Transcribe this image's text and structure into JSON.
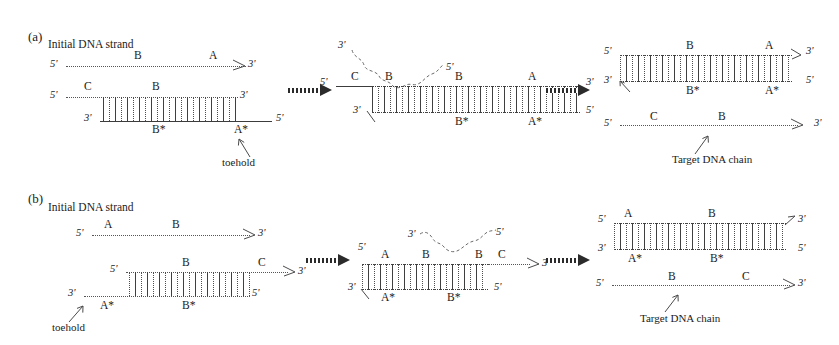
{
  "figure": {
    "background_color": "#ffffff",
    "ink_color": "#1b1b1b",
    "panels": [
      {
        "tag": "(a)",
        "caption": "Initial DNA strand",
        "stages": [
          {
            "name": "reactants",
            "strands": [
              {
                "name": "invader-strand",
                "left_end": "5'",
                "right_end": "3'",
                "domains": [
                  "B",
                  "A"
                ]
              },
              {
                "name": "substrate-top-strand",
                "left_end": "5'",
                "right_end": "3'",
                "domains": [
                  "C",
                  "B"
                ]
              },
              {
                "name": "substrate-bottom-strand",
                "left_end": "3'",
                "right_end": "5'",
                "domains": [
                  "B*",
                  "A*"
                ]
              }
            ],
            "annotation": "toehold"
          },
          {
            "name": "branch-migration-intermediate",
            "top_labels": [
              "3'",
              "5'"
            ],
            "left_end": "5'",
            "right_end": "3'",
            "bottom_left_end": "3'",
            "bottom_right_end": "5'",
            "top_domains": [
              "C",
              "B",
              "B",
              "A"
            ],
            "bottom_domains": [
              "B*",
              "A*"
            ]
          },
          {
            "name": "products",
            "duplex": {
              "left_top_end": "5'",
              "right_top_end": "3'",
              "left_bottom_end": "3'",
              "right_bottom_end": "5'",
              "top_domains": [
                "B",
                "A"
              ],
              "bottom_domains": [
                "B*",
                "A*"
              ]
            },
            "released_strand": {
              "left_end": "5'",
              "right_end": "3'",
              "domains": [
                "C",
                "B"
              ],
              "annotation": "Target DNA chain"
            }
          }
        ]
      },
      {
        "tag": "(b)",
        "caption": "Initial DNA strand",
        "stages": [
          {
            "name": "reactants",
            "strands": [
              {
                "name": "invader-strand",
                "left_end": "5'",
                "right_end": "3'",
                "domains": [
                  "A",
                  "B"
                ]
              },
              {
                "name": "substrate-top-strand",
                "left_end": "5'",
                "right_end": "3'",
                "domains": [
                  "B",
                  "C"
                ]
              },
              {
                "name": "substrate-bottom-strand",
                "left_end": "3'",
                "right_end": "5'",
                "domains": [
                  "A*",
                  "B*"
                ]
              }
            ],
            "annotation": "toehold"
          },
          {
            "name": "branch-migration-intermediate",
            "top_labels": [
              "3'",
              "5'"
            ],
            "left_end": "5'",
            "right_end": "3'",
            "bottom_left_end": "3'",
            "bottom_right_end": "5'",
            "top_domains": [
              "A",
              "B",
              "B",
              "C"
            ],
            "bottom_domains": [
              "A*",
              "B*"
            ]
          },
          {
            "name": "products",
            "duplex": {
              "left_top_end": "5'",
              "right_top_end": "3'",
              "left_bottom_end": "3'",
              "right_bottom_end": "5'",
              "top_domains": [
                "A",
                "B"
              ],
              "bottom_domains": [
                "A*",
                "B*"
              ]
            },
            "released_strand": {
              "left_end": "5'",
              "right_end": "3'",
              "domains": [
                "B",
                "C"
              ],
              "annotation": "Target DNA chain"
            }
          }
        ]
      }
    ]
  },
  "a": {
    "tag": "(a)",
    "caption": "Initial DNA strand",
    "s1": {
      "top": {
        "l5": "5'",
        "r3": "3'",
        "dB": "B",
        "dA": "A"
      },
      "mid": {
        "l5": "5'",
        "r3": "3'",
        "dC": "C",
        "dB": "B"
      },
      "bot": {
        "l3": "3'",
        "r5": "5'",
        "dBs": "B*",
        "dAs": "A*"
      },
      "toehold": "toehold"
    },
    "s2": {
      "up3": "3'",
      "up5": "5'",
      "l5": "5'",
      "r3": "3'",
      "bl3": "3'",
      "br5": "5'",
      "dC": "C",
      "dB1": "B",
      "dB2": "B",
      "dA": "A",
      "dBs": "B*",
      "dAs": "A*"
    },
    "s3": {
      "l5": "5'",
      "r3": "3'",
      "bl3": "3'",
      "br5": "5'",
      "dB": "B",
      "dA": "A",
      "dBs": "B*",
      "dAs": "A*",
      "rel5": "5'",
      "rel3": "3'",
      "dC": "C",
      "dBr": "B",
      "target": "Target DNA chain"
    }
  },
  "b": {
    "tag": "(b)",
    "caption": "Initial DNA strand",
    "s1": {
      "top": {
        "l5": "5'",
        "r3": "3'",
        "dA": "A",
        "dB": "B"
      },
      "mid": {
        "l5": "5'",
        "r3": "3'",
        "dB": "B",
        "dC": "C"
      },
      "bot": {
        "l3": "3'",
        "r5": "5'",
        "dAs": "A*",
        "dBs": "B*"
      },
      "toehold": "toehold"
    },
    "s2": {
      "up3": "3'",
      "up5": "5'",
      "l5": "5'",
      "r3": "3'",
      "bl3": "3'",
      "br5": "5'",
      "dA": "A",
      "dB1": "B",
      "dB2": "B",
      "dC": "C",
      "dAs": "A*",
      "dBs": "B*"
    },
    "s3": {
      "l5": "5'",
      "r3": "3'",
      "bl3": "3'",
      "br5": "5'",
      "dA": "A",
      "dB": "B",
      "dAs": "A*",
      "dBs": "B*",
      "rel5": "5'",
      "rel3": "3'",
      "dBr": "B",
      "dC": "C",
      "target": "Target DNA chain"
    }
  }
}
